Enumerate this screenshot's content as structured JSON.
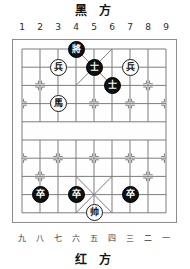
{
  "board": {
    "black_side_label": "黑 方",
    "red_side_label": "红 方",
    "top_file_labels": [
      "1",
      "2",
      "3",
      "4",
      "5",
      "6",
      "7",
      "8",
      "9"
    ],
    "bottom_file_labels": [
      "九",
      "八",
      "七",
      "六",
      "五",
      "四",
      "三",
      "二",
      "一"
    ],
    "files": 9,
    "ranks": 10,
    "river_label": "",
    "colors": {
      "line": "#7d7d7d",
      "border": "#8d8d8d",
      "black_piece_bg": "#101010",
      "black_piece_text": "#ffffff",
      "red_piece_bg": "#ffffff",
      "red_piece_text": "#111111",
      "background": "#ffffff"
    },
    "pieces": [
      {
        "name": "black-general",
        "glyph": "將",
        "side": "black",
        "file": 4,
        "rank": 0
      },
      {
        "name": "red-pawn-left",
        "glyph": "兵",
        "side": "red",
        "file": 3,
        "rank": 1
      },
      {
        "name": "black-advisor-1",
        "glyph": "士",
        "side": "black",
        "file": 5,
        "rank": 1
      },
      {
        "name": "red-pawn-right",
        "glyph": "兵",
        "side": "red",
        "file": 7,
        "rank": 1
      },
      {
        "name": "black-advisor-2",
        "glyph": "士",
        "side": "black",
        "file": 6,
        "rank": 2
      },
      {
        "name": "red-horse",
        "glyph": "馬",
        "side": "red",
        "file": 3,
        "rank": 3
      },
      {
        "name": "black-pawn-1",
        "glyph": "卒",
        "side": "black",
        "file": 2,
        "rank": 8
      },
      {
        "name": "black-pawn-2",
        "glyph": "卒",
        "side": "black",
        "file": 4,
        "rank": 8
      },
      {
        "name": "black-pawn-3",
        "glyph": "卒",
        "side": "black",
        "file": 7,
        "rank": 8
      },
      {
        "name": "red-general",
        "glyph": "帅",
        "side": "red",
        "file": 5,
        "rank": 9
      }
    ]
  }
}
